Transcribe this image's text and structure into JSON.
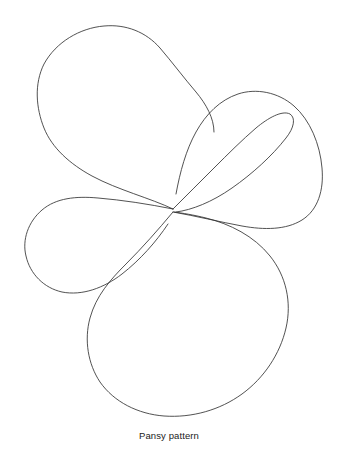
{
  "page": {
    "background_color": "#ffffff",
    "width": 338,
    "height": 449
  },
  "running_head": {
    "text": ""
  },
  "caption": {
    "text": "Pansy pattern"
  },
  "drawing": {
    "title": "Pansy pattern",
    "type": "line-drawing",
    "stroke_color": "#333333",
    "stroke_width": 0.85,
    "fill": "none",
    "center_point": {
      "x": 173,
      "y": 209
    },
    "petal_count": 5,
    "petals": [
      {
        "name": "upper-left-petal",
        "label": "Upper left petal",
        "order": 1,
        "bounds": {
          "x": 22,
          "y": 22,
          "width": 170,
          "height": 210
        },
        "path": "M173 209 C 150 198, 118 190, 92 176 C 70 164, 52 148, 44 128 C 36 108, 34 84, 44 64 C 56 42, 80 28, 104 26 C 126 24, 146 32, 160 48 C 172 62, 184 78, 196 92 C 206 104, 214 118, 214 132"
      },
      {
        "name": "mid-left-petal",
        "label": "Middle left petal",
        "order": 2,
        "bounds": {
          "x": 22,
          "y": 110,
          "width": 155,
          "height": 160
        },
        "path": "M173 209 C 148 204, 122 200, 98 198 C 76 196, 56 198, 42 210 C 28 222, 22 240, 26 256 C 30 274, 44 288, 62 292 C 82 296, 104 288, 122 274 C 140 260, 156 242, 168 224"
      },
      {
        "name": "upper-right-petal",
        "label": "Upper right petal",
        "order": 3,
        "bounds": {
          "x": 165,
          "y": 92,
          "width": 125,
          "height": 125
        },
        "path": "M173 209 C 186 196, 200 182, 214 168 C 228 154, 242 140, 256 128 C 268 118, 282 110, 290 114 C 296 118, 294 128, 286 138 C 272 156, 252 174, 232 188 C 212 202, 192 210, 176 212"
      },
      {
        "name": "right-petal",
        "label": "Right petal",
        "order": 4,
        "bounds": {
          "x": 170,
          "y": 90,
          "width": 155,
          "height": 180
        },
        "path": "M173 212 C 196 216, 220 222, 242 226 C 264 230, 286 230, 302 220 C 318 210, 324 190, 322 168 C 320 144, 310 120, 294 106 C 278 92, 256 88, 238 94 C 220 100, 206 114, 196 132 C 186 150, 180 172, 176 194"
      },
      {
        "name": "bottom-petal",
        "label": "Bottom petal",
        "order": 5,
        "bounds": {
          "x": 88,
          "y": 210,
          "width": 200,
          "height": 208
        },
        "path": "M173 212 C 158 230, 142 248, 126 264 C 110 280, 96 296, 90 318 C 84 340, 88 364, 100 382 C 114 402, 138 414, 164 416 C 192 418, 220 410, 242 394 C 264 378, 280 354, 286 328 C 292 302, 286 276, 270 256 C 254 236, 230 224, 206 218 C 194 215, 182 213, 174 212"
      }
    ]
  }
}
